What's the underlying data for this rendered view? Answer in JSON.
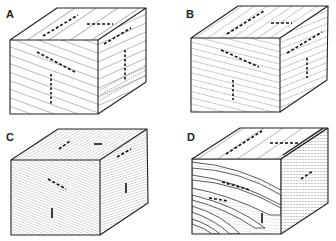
{
  "figure": {
    "panels": [
      {
        "label": "A",
        "description": "Block with planar parallel laminae cutting all faces; symmetric ripple/paired arrows on top and faces"
      },
      {
        "label": "B",
        "description": "Block with closely spaced planar lamination (fine dotted texture) and arrow markings"
      },
      {
        "label": "C",
        "description": "Block with very fine dense planar lamination; small arrows on faces"
      },
      {
        "label": "D",
        "description": "Block with curved (trough/tangential) cross-lamination on front face and dense lamination on side"
      }
    ],
    "colors": {
      "line": "#333333",
      "background": "#ffffff"
    }
  }
}
